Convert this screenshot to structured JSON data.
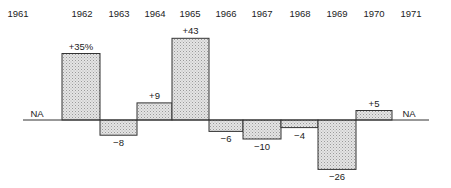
{
  "chart_data": {
    "type": "bar",
    "title": "",
    "xlabel": "",
    "ylabel": "",
    "categories": [
      "1961",
      "1962",
      "1963",
      "1964",
      "1965",
      "1966",
      "1967",
      "1968",
      "1969",
      "1970",
      "1971"
    ],
    "values": [
      null,
      35,
      -8,
      9,
      43,
      -6,
      -10,
      -4,
      -26,
      5,
      null
    ],
    "value_labels": [
      "NA",
      "+35%",
      "−8",
      "+9",
      "+43",
      "−6",
      "−10",
      "−4",
      "−26",
      "+5",
      "NA"
    ],
    "unit": "%",
    "ylim": [
      -30,
      45
    ],
    "grid": false,
    "legend": null,
    "fill_pattern": "stippled-gray",
    "colors": {
      "fill": "#d6d6d6",
      "stroke": "#333333",
      "axis": "#333333",
      "text": "#222222"
    }
  },
  "layout": {
    "baseline_y": 120,
    "px_per_unit": 1.9,
    "axis_x_start": 23,
    "axis_x_end": 429,
    "year_label_y": 17,
    "year_label_x": [
      18,
      82,
      119,
      155,
      190,
      226,
      262,
      300,
      337,
      374,
      411
    ],
    "bar_edges": [
      62,
      100,
      137,
      172,
      209,
      243,
      281,
      318,
      356,
      392
    ],
    "na_positions": [
      {
        "x": 37,
        "y": 117
      },
      {
        "x": 409,
        "y": 117
      }
    ]
  }
}
